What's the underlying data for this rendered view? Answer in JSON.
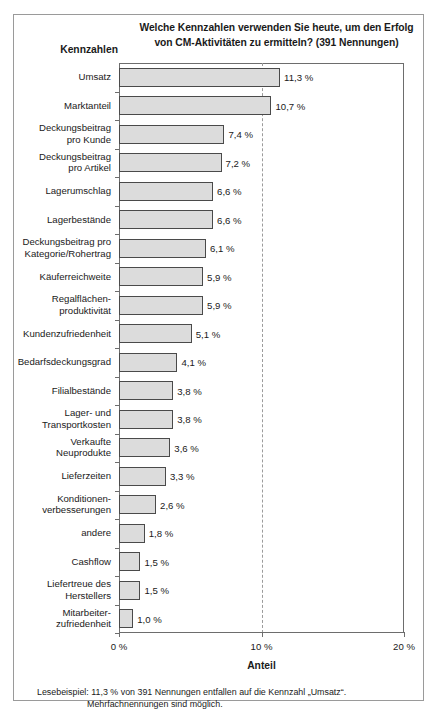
{
  "figure": {
    "title": "Welche Kennzahlen verwenden Sie heute, um den Erfolg von CM-Aktivitäten zu ermitteln? (391 Nennungen)",
    "title_line1": "Welche Kennzahlen verwenden Sie heute, um den Erfolg",
    "title_line2": "von CM-Aktivitäten zu ermitteln? (391 Nennungen)",
    "y_axis_title": "Kennzahlen",
    "x_axis_title": "Anteil",
    "footnote_line1": "Lesebeispiel: 11,3 % von 391 Nennungen entfallen auf die Kennzahl „Umsatz“.",
    "footnote_line2": "Mehrfachnennungen sind möglich.",
    "colors": {
      "bar_fill": "#dcdcdc",
      "bar_border": "#4a4a4a",
      "axis": "#6d6d6d",
      "gridline": "#9b9b9b",
      "frame": "#9a9a9a",
      "text": "#1a1a1a"
    }
  },
  "chart_data": {
    "type": "bar",
    "orientation": "horizontal",
    "title": "Welche Kennzahlen verwenden Sie heute, um den Erfolg von CM-Aktivitäten zu ermitteln? (391 Nennungen)",
    "xlabel": "Anteil",
    "ylabel": "Kennzahlen",
    "xlim": [
      0,
      20
    ],
    "xticks": [
      0,
      10,
      20
    ],
    "xtick_labels": [
      "0 %",
      "10 %",
      "20 %"
    ],
    "grid": "dashed vertical gridline at 10 %",
    "legend": "none",
    "unit": "%",
    "total_responses": 391,
    "categories": [
      "Umsatz",
      "Marktanteil",
      "Deckungsbeitrag pro Kunde",
      "Deckungsbeitrag pro Artikel",
      "Lagerumschlag",
      "Lagerbestände",
      "Deckungsbeitrag pro Kategorie/Rohertrag",
      "Käuferreichweite",
      "Regalflächenproduktivität",
      "Kundenzufriedenheit",
      "Bedarfsdeckungsgrad",
      "Filialbestände",
      "Lager- und Transportkosten",
      "Verkaufte Neuprodukte",
      "Lieferzeiten",
      "Konditionenverbesserungen",
      "andere",
      "Cashflow",
      "Liefertreue des Herstellers",
      "Mitarbeiterzufriedenheit"
    ],
    "values": [
      11.3,
      10.7,
      7.4,
      7.2,
      6.6,
      6.6,
      6.1,
      5.9,
      5.9,
      5.1,
      4.1,
      3.8,
      3.8,
      3.6,
      3.3,
      2.6,
      1.8,
      1.5,
      1.5,
      1.0
    ],
    "value_labels": [
      "11,3 %",
      "10,7 %",
      "7,4 %",
      "7,2 %",
      "6,6 %",
      "6,6 %",
      "6,1 %",
      "5,9 %",
      "5,9 %",
      "5,1 %",
      "4,1 %",
      "3,8 %",
      "3,8 %",
      "3,6 %",
      "3,3 %",
      "2,6 %",
      "1,8 %",
      "1,5 %",
      "1,5 %",
      "1,0 %"
    ],
    "category_label_lines": [
      [
        "Umsatz"
      ],
      [
        "Marktanteil"
      ],
      [
        "Deckungsbeitrag",
        "pro Kunde"
      ],
      [
        "Deckungsbeitrag",
        "pro Artikel"
      ],
      [
        "Lagerumschlag"
      ],
      [
        "Lagerbestände"
      ],
      [
        "Deckungsbeitrag pro",
        "Kategorie/Rohertrag"
      ],
      [
        "Käuferreichweite"
      ],
      [
        "Regalflächen-",
        "produktivität"
      ],
      [
        "Kundenzufriedenheit"
      ],
      [
        "Bedarfsdeckungsgrad"
      ],
      [
        "Filialbestände"
      ],
      [
        "Lager- und",
        "Transportkosten"
      ],
      [
        "Verkaufte",
        "Neuprodukte"
      ],
      [
        "Lieferzeiten"
      ],
      [
        "Konditionen-",
        "verbesserungen"
      ],
      [
        "andere"
      ],
      [
        "Cashflow"
      ],
      [
        "Liefertreue des",
        "Herstellers"
      ],
      [
        "Mitarbeiter-",
        "zufriedenheit"
      ]
    ]
  }
}
